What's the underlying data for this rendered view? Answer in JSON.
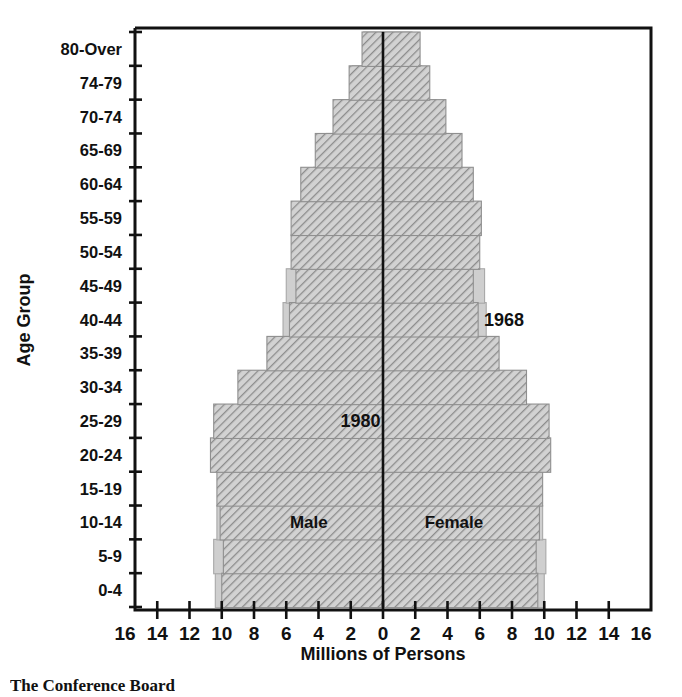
{
  "caption": "The Conference Board",
  "chart_data": {
    "type": "bar",
    "subtype": "population-pyramid",
    "title": "",
    "xlabel": "Millions of Persons",
    "ylabel": "Age Group",
    "categories": [
      "0-4",
      "5-9",
      "10-14",
      "15-19",
      "20-24",
      "25-29",
      "30-34",
      "35-39",
      "40-44",
      "45-49",
      "50-54",
      "55-59",
      "60-64",
      "65-69",
      "70-74",
      "74-79",
      "80-Over"
    ],
    "x_tick_labels": [
      "16",
      "14",
      "12",
      "10",
      "8",
      "6",
      "4",
      "2",
      "0",
      "2",
      "4",
      "6",
      "8",
      "10",
      "12",
      "14",
      "16"
    ],
    "x_tick_values": [
      -16,
      -14,
      -12,
      -10,
      -8,
      -6,
      -4,
      -2,
      0,
      2,
      4,
      6,
      8,
      10,
      12,
      14,
      16
    ],
    "xlim": [
      -16,
      16
    ],
    "grid": false,
    "legend_position": "in-plot",
    "annotations": [
      {
        "text": "1968",
        "x": 7.5,
        "y": "40-44"
      },
      {
        "text": "1980",
        "x": -1.4,
        "y": "25-29"
      },
      {
        "text": "Male",
        "x": -4.6,
        "y": "10-14"
      },
      {
        "text": "Female",
        "x": 4.4,
        "y": "10-14"
      }
    ],
    "series": [
      {
        "name": "1968",
        "style": "solid-gray",
        "color": "#c9c9c9",
        "male": [
          10.4,
          10.5,
          10.3,
          9.1,
          7.3,
          5.9,
          5.5,
          5.9,
          6.2,
          6.0,
          5.6,
          5.1,
          4.3,
          3.5,
          2.7,
          1.9,
          1.2
        ],
        "female": [
          10.0,
          10.1,
          9.9,
          8.8,
          7.2,
          5.9,
          5.6,
          6.1,
          6.4,
          6.3,
          5.9,
          5.5,
          4.8,
          4.1,
          3.3,
          2.4,
          1.8
        ]
      },
      {
        "name": "1980",
        "style": "diagonal-hatch",
        "color": "#b4b4b4",
        "male": [
          10.0,
          9.9,
          10.1,
          10.3,
          10.7,
          10.5,
          9.0,
          7.2,
          5.8,
          5.4,
          5.7,
          5.7,
          5.1,
          4.2,
          3.1,
          2.1,
          1.3
        ],
        "female": [
          9.6,
          9.5,
          9.7,
          9.9,
          10.4,
          10.3,
          8.9,
          7.2,
          5.9,
          5.6,
          6.0,
          6.1,
          5.6,
          4.9,
          3.9,
          2.9,
          2.3
        ]
      }
    ]
  }
}
